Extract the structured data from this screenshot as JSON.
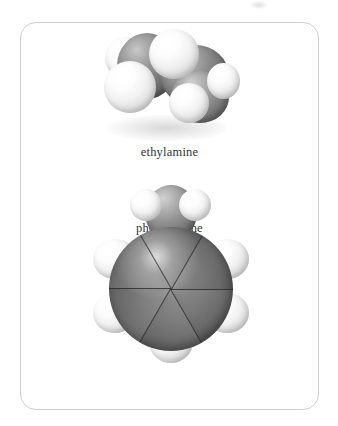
{
  "figure": {
    "kind": "space-filling molecular models",
    "background_color": "#ffffff",
    "frame_border_color": "#cfcfcf",
    "caption_color": "#333333"
  },
  "molecules": [
    {
      "id": "ethylamine",
      "caption": "ethylamine",
      "formula_note": "CH3CH2NH2",
      "atoms": [
        {
          "element": "H",
          "color": "#f2f2f2"
        },
        {
          "element": "C",
          "color": "#7a7a7a"
        },
        {
          "element": "H",
          "color": "#f2f2f2"
        },
        {
          "element": "H",
          "color": "#f2f2f2"
        },
        {
          "element": "C",
          "color": "#7a7a7a"
        },
        {
          "element": "H",
          "color": "#f2f2f2"
        },
        {
          "element": "N",
          "color": "#7c7c7c"
        },
        {
          "element": "H",
          "color": "#f2f2f2"
        }
      ]
    },
    {
      "id": "phenylamine",
      "caption": "phenylamine",
      "formula_note": "C6H5NH2",
      "atoms": [
        {
          "element": "N",
          "color": "#7c7c7c"
        },
        {
          "element": "H",
          "color": "#f2f2f2"
        },
        {
          "element": "H",
          "color": "#f2f2f2"
        },
        {
          "element": "C",
          "color": "#6b6b6b"
        },
        {
          "element": "C",
          "color": "#6b6b6b"
        },
        {
          "element": "C",
          "color": "#6b6b6b"
        },
        {
          "element": "C",
          "color": "#6b6b6b"
        },
        {
          "element": "C",
          "color": "#6b6b6b"
        },
        {
          "element": "C",
          "color": "#6b6b6b"
        },
        {
          "element": "H",
          "color": "#f2f2f2"
        },
        {
          "element": "H",
          "color": "#f2f2f2"
        },
        {
          "element": "H",
          "color": "#f2f2f2"
        },
        {
          "element": "H",
          "color": "#f2f2f2"
        },
        {
          "element": "H",
          "color": "#f2f2f2"
        }
      ]
    }
  ]
}
